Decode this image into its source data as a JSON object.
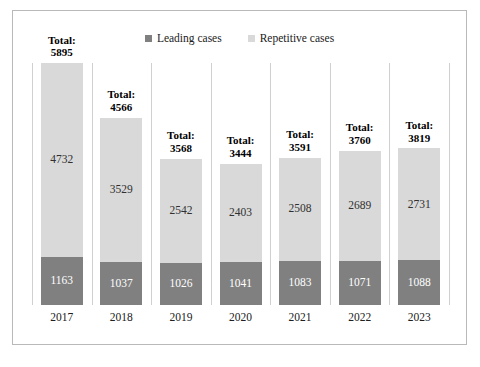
{
  "chart_data": {
    "type": "bar",
    "title": "",
    "subtitle": "",
    "xlabel": "",
    "ylabel": "",
    "stacked": true,
    "orientation": "vertical",
    "grid": "vertical-category-separators",
    "legend_position": "top-center",
    "ylim": [
      0,
      5895
    ],
    "categories": [
      "2017",
      "2018",
      "2019",
      "2020",
      "2021",
      "2022",
      "2023"
    ],
    "series": [
      {
        "name": "Leading cases",
        "color": "#808080",
        "values": [
          1163,
          1037,
          1026,
          1041,
          1083,
          1071,
          1088
        ]
      },
      {
        "name": "Repetitive cases",
        "color": "#d9d9d9",
        "values": [
          4732,
          3529,
          2542,
          2403,
          2508,
          2689,
          2731
        ]
      }
    ],
    "totals": [
      5895,
      4566,
      3568,
      3444,
      3591,
      3760,
      3819
    ],
    "total_prefix": "Total:"
  },
  "legend": {
    "items": [
      {
        "label": "Leading cases",
        "color": "#808080"
      },
      {
        "label": "Repetitive cases",
        "color": "#d9d9d9"
      }
    ]
  },
  "colors": {
    "leading": "#808080",
    "repetitive": "#d9d9d9",
    "frame_border": "#b9b9b9",
    "gridline": "#d0d0d0",
    "background": "#ffffff"
  }
}
